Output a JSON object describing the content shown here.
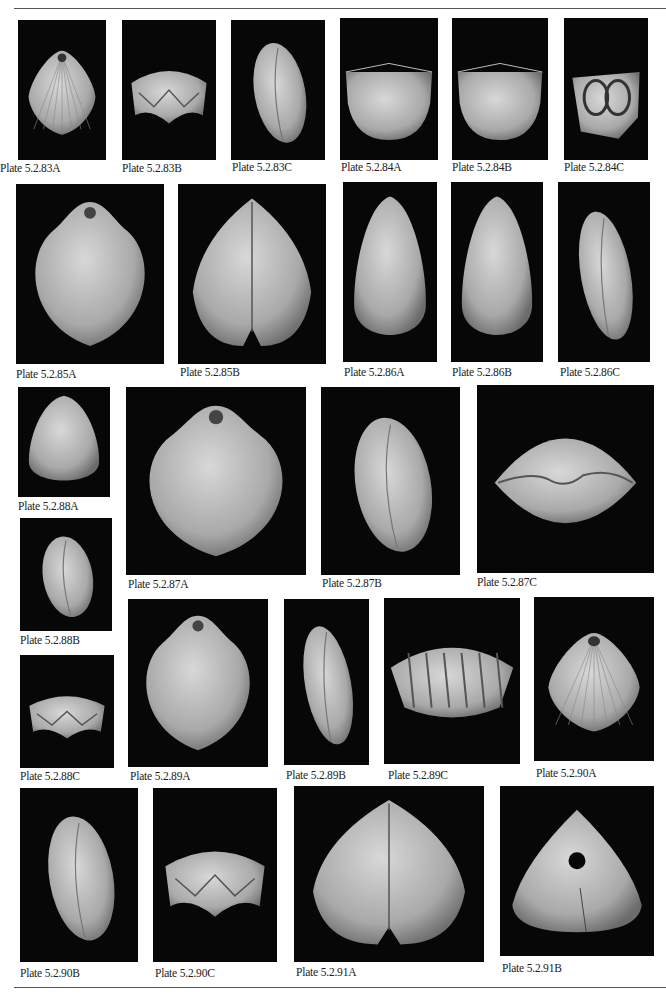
{
  "page": {
    "header_text": "CLASS RHYNCHONELLATA   11"
  },
  "plates": [
    {
      "id": "83A",
      "label": "Plate 5.2.83A",
      "x": 18,
      "y": 20,
      "w": 88,
      "h": 140,
      "shape": "fan",
      "lx": 0,
      "ly": 162
    },
    {
      "id": "83B",
      "label": "Plate 5.2.83B",
      "x": 122,
      "y": 20,
      "w": 94,
      "h": 140,
      "shape": "wave",
      "lx": 122,
      "ly": 162
    },
    {
      "id": "83C",
      "label": "Plate 5.2.83C",
      "x": 231,
      "y": 20,
      "w": 94,
      "h": 140,
      "shape": "side",
      "lx": 232,
      "ly": 161
    },
    {
      "id": "84A",
      "label": "Plate 5.2.84A",
      "x": 340,
      "y": 18,
      "w": 98,
      "h": 142,
      "shape": "cup",
      "lx": 341,
      "ly": 161
    },
    {
      "id": "84B",
      "label": "Plate 5.2.84B",
      "x": 452,
      "y": 18,
      "w": 96,
      "h": 142,
      "shape": "cup",
      "lx": 452,
      "ly": 161
    },
    {
      "id": "84C",
      "label": "Plate 5.2.84C",
      "x": 564,
      "y": 18,
      "w": 84,
      "h": 142,
      "shape": "interior",
      "lx": 564,
      "ly": 161
    },
    {
      "id": "85A",
      "label": "Plate 5.2.85A",
      "x": 16,
      "y": 184,
      "w": 148,
      "h": 180,
      "shape": "round",
      "lx": 16,
      "ly": 368
    },
    {
      "id": "85B",
      "label": "Plate 5.2.85B",
      "x": 178,
      "y": 184,
      "w": 148,
      "h": 180,
      "shape": "heart",
      "lx": 180,
      "ly": 366
    },
    {
      "id": "86A",
      "label": "Plate 5.2.86A",
      "x": 343,
      "y": 182,
      "w": 94,
      "h": 180,
      "shape": "oval",
      "lx": 344,
      "ly": 366
    },
    {
      "id": "86B",
      "label": "Plate 5.2.86B",
      "x": 451,
      "y": 182,
      "w": 92,
      "h": 180,
      "shape": "oval",
      "lx": 452,
      "ly": 366
    },
    {
      "id": "86C",
      "label": "Plate 5.2.86C",
      "x": 558,
      "y": 182,
      "w": 92,
      "h": 180,
      "shape": "side",
      "lx": 560,
      "ly": 366
    },
    {
      "id": "88A",
      "label": "Plate 5.2.88A",
      "x": 18,
      "y": 387,
      "w": 92,
      "h": 110,
      "shape": "oval",
      "lx": 18,
      "ly": 500
    },
    {
      "id": "87A",
      "label": "Plate 5.2.87A",
      "x": 126,
      "y": 387,
      "w": 180,
      "h": 188,
      "shape": "round",
      "lx": 128,
      "ly": 578
    },
    {
      "id": "87B",
      "label": "Plate 5.2.87B",
      "x": 321,
      "y": 387,
      "w": 139,
      "h": 188,
      "shape": "side",
      "lx": 322,
      "ly": 577
    },
    {
      "id": "87C",
      "label": "Plate 5.2.87C",
      "x": 477,
      "y": 385,
      "w": 177,
      "h": 188,
      "shape": "lens",
      "lx": 477,
      "ly": 576
    },
    {
      "id": "88B",
      "label": "Plate 5.2.88B",
      "x": 20,
      "y": 518,
      "w": 92,
      "h": 113,
      "shape": "side",
      "lx": 20,
      "ly": 634
    },
    {
      "id": "88C",
      "label": "Plate 5.2.88C",
      "x": 20,
      "y": 655,
      "w": 94,
      "h": 113,
      "shape": "wave",
      "lx": 20,
      "ly": 770
    },
    {
      "id": "89A",
      "label": "Plate 5.2.89A",
      "x": 128,
      "y": 599,
      "w": 140,
      "h": 168,
      "shape": "round",
      "lx": 130,
      "ly": 770
    },
    {
      "id": "89B",
      "label": "Plate 5.2.89B",
      "x": 284,
      "y": 599,
      "w": 85,
      "h": 166,
      "shape": "side",
      "lx": 286,
      "ly": 769
    },
    {
      "id": "89C",
      "label": "Plate 5.2.89C",
      "x": 384,
      "y": 598,
      "w": 136,
      "h": 166,
      "shape": "ribwide",
      "lx": 388,
      "ly": 769
    },
    {
      "id": "90A",
      "label": "Plate 5.2.90A",
      "x": 534,
      "y": 597,
      "w": 120,
      "h": 164,
      "shape": "fan",
      "lx": 536,
      "ly": 767
    },
    {
      "id": "90B",
      "label": "Plate 5.2.90B",
      "x": 20,
      "y": 788,
      "w": 118,
      "h": 174,
      "shape": "side",
      "lx": 20,
      "ly": 967
    },
    {
      "id": "90C",
      "label": "Plate 5.2.90C",
      "x": 153,
      "y": 788,
      "w": 124,
      "h": 174,
      "shape": "wave",
      "lx": 155,
      "ly": 967
    },
    {
      "id": "91A",
      "label": "Plate 5.2.91A",
      "x": 294,
      "y": 786,
      "w": 190,
      "h": 176,
      "shape": "heart",
      "lx": 296,
      "ly": 966
    },
    {
      "id": "91B",
      "label": "Plate 5.2.91B",
      "x": 500,
      "y": 786,
      "w": 154,
      "h": 170,
      "shape": "triangle",
      "lx": 502,
      "ly": 962
    }
  ],
  "colors": {
    "plate_bg": "#070707",
    "shell_light": "#d8d8d8",
    "shell_mid": "#a9a9a9",
    "label_text": "#222222"
  }
}
